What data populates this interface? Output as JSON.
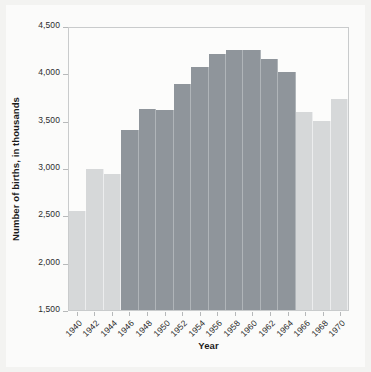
{
  "chart_data": {
    "type": "bar",
    "title": "",
    "xlabel": "Year",
    "ylabel": "Number of births, in thousands",
    "categories": [
      "1940",
      "1942",
      "1944",
      "1946",
      "1948",
      "1950",
      "1952",
      "1954",
      "1956",
      "1958",
      "1960",
      "1962",
      "1964",
      "1966",
      "1968",
      "1970"
    ],
    "values": [
      2550,
      2985,
      2940,
      3400,
      3625,
      3610,
      3890,
      4070,
      4200,
      4250,
      4245,
      4150,
      4015,
      3595,
      3495,
      3725
    ],
    "ylim": [
      1500,
      4500
    ],
    "ytick_values": [
      1500,
      2000,
      2500,
      3000,
      3500,
      4000,
      4500
    ],
    "ytick_labels": [
      "1,500",
      "2,000",
      "2,500",
      "3,000",
      "3,500",
      "4,000",
      "4,500"
    ],
    "xtick_labels": [
      "1940",
      "1942",
      "1944",
      "1946",
      "1948",
      "1950",
      "1952",
      "1954",
      "1956",
      "1958",
      "1960",
      "1962",
      "1964",
      "1966",
      "1968",
      "1970"
    ],
    "grid": false,
    "legend": "none",
    "highlight_categories": [
      "1946",
      "1948",
      "1950",
      "1952",
      "1954",
      "1956",
      "1958",
      "1960",
      "1962",
      "1964"
    ],
    "colors": {
      "bar": "#d6d8d9",
      "bar_highlight": "#8f959b",
      "axis": "#c9cbcc",
      "text": "#2c2c2c",
      "background": "#fbfbfa"
    }
  }
}
